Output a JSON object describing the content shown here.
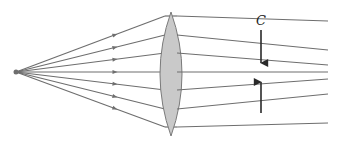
{
  "diagram": {
    "labels": {
      "circle_of_least_confusion": "C"
    },
    "colors": {
      "ray": "#6e6e6e",
      "lens_fill": "#c9c9c9",
      "lens_stroke": "#7a7a7a",
      "marker": "#2a2a2a",
      "source": "#6e6e6e"
    },
    "source": {
      "x": 16,
      "y": 72
    },
    "lens": {
      "cx": 171,
      "top": 12,
      "bottom": 136,
      "half_width": 11
    },
    "rays": [
      {
        "lens_y": 16,
        "end_x": 328,
        "end_y": 21
      },
      {
        "lens_y": 35,
        "end_x": 328,
        "end_y": 50
      },
      {
        "lens_y": 53,
        "end_x": 328,
        "end_y": 65
      },
      {
        "lens_y": 72,
        "end_x": 328,
        "end_y": 72
      },
      {
        "lens_y": 90,
        "end_x": 328,
        "end_y": 79
      },
      {
        "lens_y": 109,
        "end_x": 328,
        "end_y": 94
      },
      {
        "lens_y": 127,
        "end_x": 328,
        "end_y": 123
      }
    ],
    "marker": {
      "x": 261,
      "top": 30,
      "gap_top": 63,
      "gap_bottom": 82,
      "bottom": 113,
      "label_y": 14
    }
  }
}
